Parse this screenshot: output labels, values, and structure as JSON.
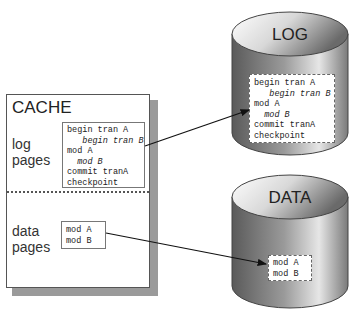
{
  "cache": {
    "title": "CACHE",
    "log_section": {
      "label_line1": "log",
      "label_line2": "pages",
      "entries": [
        {
          "text": "begin tran A",
          "indent": 0,
          "italic": false
        },
        {
          "text": "begin tran B",
          "indent": 3,
          "italic": true
        },
        {
          "text": "mod A",
          "indent": 0,
          "italic": false
        },
        {
          "text": "mod B",
          "indent": 2,
          "italic": true
        },
        {
          "text": "commit tranA",
          "indent": 0,
          "italic": false
        },
        {
          "text": "checkpoint",
          "indent": 0,
          "italic": false
        }
      ]
    },
    "data_section": {
      "label_line1": "data",
      "label_line2": "pages",
      "entries": [
        "mod A",
        "mod B"
      ]
    }
  },
  "log_db": {
    "label": "LOG",
    "entries": [
      {
        "text": "begin tran A",
        "indent": 0,
        "italic": false
      },
      {
        "text": "begin tran B",
        "indent": 3,
        "italic": true
      },
      {
        "text": "mod A",
        "indent": 0,
        "italic": false
      },
      {
        "text": "mod B",
        "indent": 2,
        "italic": true
      },
      {
        "text": "commit tranA",
        "indent": 0,
        "italic": false
      },
      {
        "text": "checkpoint",
        "indent": 0,
        "italic": false
      }
    ]
  },
  "data_db": {
    "label": "DATA",
    "entries": [
      "mod A",
      "mod B"
    ]
  },
  "arrows": [
    {
      "from": "cache-log-pages",
      "to": "log-db",
      "x1": 145,
      "y1": 146,
      "x2": 249,
      "y2": 110
    },
    {
      "from": "cache-data-pages",
      "to": "data-db",
      "x1": 106,
      "y1": 233,
      "x2": 266,
      "y2": 264
    }
  ]
}
